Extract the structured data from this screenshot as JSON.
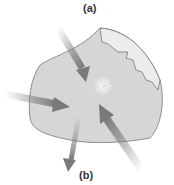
{
  "labels": {
    "top": "(a)",
    "bottom": "(b)"
  },
  "colors": {
    "cell_fill": "#d6d6d6",
    "cell_light": "#ececec",
    "outline": "#777777",
    "arrow": "#8a8a8a"
  }
}
